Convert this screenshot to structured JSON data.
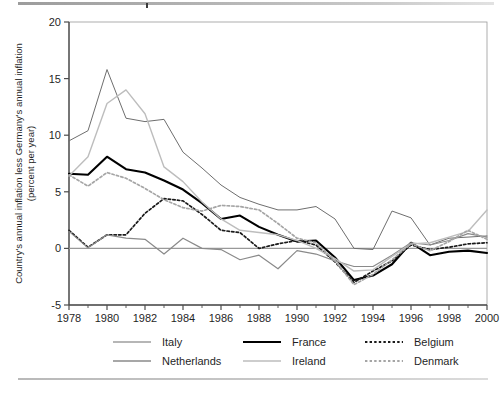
{
  "chart_data": {
    "type": "line",
    "title": "",
    "xlabel": "",
    "ylabel": "Country's annual inflation less Germany's annual inflation (percent per year)",
    "ylabel_line1": "Country's annual inflation less Germany's annual inflation",
    "ylabel_line2": "(percent per year)",
    "xlim": [
      1978,
      2000
    ],
    "ylim": [
      -5,
      20
    ],
    "yticks": [
      -5,
      0,
      5,
      10,
      15,
      20
    ],
    "ytick_labels": [
      "-5",
      "0",
      "5",
      "10",
      "15",
      "20"
    ],
    "xticks": [
      1978,
      1980,
      1982,
      1984,
      1986,
      1988,
      1990,
      1992,
      1994,
      1996,
      1998,
      2000
    ],
    "xtick_labels": [
      "1978",
      "1980",
      "1982",
      "1984",
      "1986",
      "1988",
      "1990",
      "1992",
      "1994",
      "1996",
      "1998",
      "2000"
    ],
    "x_minor_step": 1,
    "grid": false,
    "zero_line": true,
    "legend_position": "bottom",
    "x": [
      1978,
      1979,
      1980,
      1981,
      1982,
      1983,
      1984,
      1985,
      1986,
      1987,
      1988,
      1989,
      1990,
      1991,
      1992,
      1993,
      1994,
      1995,
      1996,
      1997,
      1998,
      1999,
      2000
    ],
    "series": [
      {
        "name": "Italy",
        "color": "#6e6e6e",
        "width": 1.0,
        "dash": "none",
        "values": [
          9.5,
          10.4,
          15.8,
          11.5,
          11.2,
          11.4,
          8.5,
          7.1,
          5.6,
          4.5,
          3.9,
          3.4,
          3.4,
          3.7,
          2.6,
          0.0,
          -0.1,
          3.3,
          2.7,
          0.3,
          0.9,
          1.0,
          1.1
        ]
      },
      {
        "name": "France",
        "color": "#000000",
        "width": 2.1,
        "dash": "none",
        "values": [
          6.6,
          6.5,
          8.1,
          7.0,
          6.7,
          6.0,
          5.2,
          4.0,
          2.6,
          2.9,
          1.9,
          1.2,
          0.6,
          0.7,
          -0.8,
          -2.8,
          -2.4,
          -1.4,
          0.5,
          -0.6,
          -0.3,
          -0.2,
          -0.4
        ]
      },
      {
        "name": "Belgium",
        "color": "#1a1a1a",
        "width": 1.7,
        "dash": "2.4,2.2",
        "values": [
          1.6,
          0.1,
          1.2,
          1.2,
          3.1,
          4.4,
          4.2,
          3.0,
          1.6,
          1.4,
          0.0,
          0.4,
          0.7,
          0.3,
          -1.2,
          -3.0,
          -2.0,
          -1.1,
          0.3,
          -0.1,
          0.1,
          0.4,
          0.5
        ]
      },
      {
        "name": "Netherlands",
        "color": "#8a8a8a",
        "width": 1.2,
        "dash": "none",
        "values": [
          1.5,
          0.05,
          1.2,
          0.9,
          0.8,
          -0.5,
          0.9,
          0.0,
          -0.1,
          -1.0,
          -0.6,
          -1.8,
          -0.2,
          -0.5,
          -1.1,
          -1.6,
          -1.6,
          -0.6,
          0.5,
          0.3,
          0.7,
          1.3,
          1.0
        ]
      },
      {
        "name": "Ireland",
        "color": "#bdbdbd",
        "width": 1.4,
        "dash": "none",
        "values": [
          6.4,
          8.1,
          12.8,
          14.0,
          11.9,
          7.2,
          5.9,
          4.1,
          2.6,
          1.6,
          1.4,
          1.2,
          0.7,
          0.0,
          -0.9,
          -2.0,
          -1.9,
          -0.7,
          0.4,
          0.5,
          1.0,
          1.5,
          3.4
        ]
      },
      {
        "name": "Denmark",
        "color": "#a5a5a5",
        "width": 1.7,
        "dash": "2.4,2.2",
        "values": [
          6.5,
          5.5,
          6.7,
          6.2,
          5.3,
          4.3,
          3.6,
          3.3,
          3.8,
          3.7,
          3.4,
          2.2,
          0.9,
          0.5,
          -1.1,
          -3.2,
          -2.3,
          -1.0,
          0.4,
          -0.2,
          0.6,
          1.6,
          0.8
        ]
      }
    ],
    "legend": [
      {
        "label": "Italy",
        "color": "#6e6e6e",
        "dash": "none",
        "width": 1.1,
        "row": 0,
        "col": 0
      },
      {
        "label": "France",
        "color": "#000000",
        "dash": "none",
        "width": 2.2,
        "row": 0,
        "col": 1
      },
      {
        "label": "Belgium",
        "color": "#1a1a1a",
        "dash": "2.4,2.2",
        "width": 1.8,
        "row": 0,
        "col": 2
      },
      {
        "label": "Netherlands",
        "color": "#8a8a8a",
        "dash": "none",
        "width": 1.3,
        "row": 1,
        "col": 0
      },
      {
        "label": "Ireland",
        "color": "#bdbdbd",
        "dash": "none",
        "width": 1.5,
        "row": 1,
        "col": 1
      },
      {
        "label": "Denmark",
        "color": "#a5a5a5",
        "dash": "2.4,2.2",
        "width": 1.8,
        "row": 1,
        "col": 2
      }
    ]
  },
  "page": {
    "top_rule_color": "#b4b4b4",
    "bottom_rule_color": "#c9c9c9",
    "axis_color": "#4d4d4d",
    "zero_line_color": "#999999"
  }
}
